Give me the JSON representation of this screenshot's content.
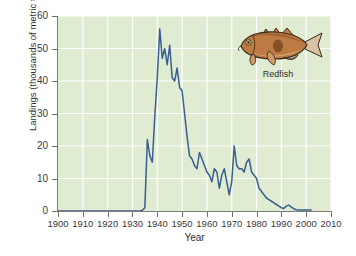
{
  "chart_data": {
    "type": "line",
    "title": "",
    "xlabel": "Year",
    "ylabel": "Landings (thousands of metric tons)",
    "xlim": [
      1900,
      2010
    ],
    "ylim": [
      0,
      60
    ],
    "xticks": [
      1900,
      1910,
      1920,
      1930,
      1940,
      1950,
      1960,
      1970,
      1980,
      1990,
      2000,
      2010
    ],
    "yticks": [
      0,
      10,
      20,
      30,
      40,
      50,
      60
    ],
    "grid": true,
    "grid_color": "#ffffff",
    "plot_background": "#dfecd2",
    "line_color": "#3a5d8f",
    "legend": "none",
    "annotations": [
      {
        "name": "species-illustration",
        "label": "Redfish",
        "x": 1990,
        "y": 48
      }
    ],
    "series": [
      {
        "name": "Redfish landings",
        "x": [
          1900,
          1905,
          1910,
          1915,
          1920,
          1925,
          1930,
          1933,
          1934,
          1935,
          1936,
          1937,
          1938,
          1939,
          1940,
          1941,
          1942,
          1943,
          1944,
          1945,
          1946,
          1947,
          1948,
          1949,
          1950,
          1951,
          1952,
          1953,
          1954,
          1955,
          1956,
          1957,
          1958,
          1959,
          1960,
          1961,
          1962,
          1963,
          1964,
          1965,
          1966,
          1967,
          1968,
          1969,
          1970,
          1971,
          1972,
          1973,
          1974,
          1975,
          1976,
          1977,
          1978,
          1979,
          1980,
          1981,
          1982,
          1983,
          1984,
          1985,
          1986,
          1987,
          1988,
          1989,
          1990,
          1991,
          1992,
          1993,
          1994,
          1995,
          1996,
          1997,
          1998,
          1999,
          2000,
          2001,
          2002
        ],
        "values": [
          0,
          0,
          0,
          0,
          0,
          0,
          0,
          0,
          0.2,
          1,
          22,
          17,
          15,
          29,
          41,
          56,
          47,
          50,
          45,
          51,
          41,
          40,
          44,
          38,
          37,
          30,
          23,
          17,
          16,
          14,
          13,
          18,
          16,
          14,
          12,
          11,
          9,
          13,
          12,
          7,
          11,
          13,
          9,
          5,
          9,
          20,
          14,
          13,
          13,
          12,
          15,
          16,
          12,
          11,
          10,
          7,
          6,
          5,
          4,
          3.5,
          3,
          2.5,
          2,
          1.5,
          1,
          0.8,
          1.5,
          1.8,
          1.2,
          0.7,
          0.4,
          0.3,
          0.3,
          0.3,
          0.3,
          0.3,
          0.3
        ]
      }
    ]
  }
}
